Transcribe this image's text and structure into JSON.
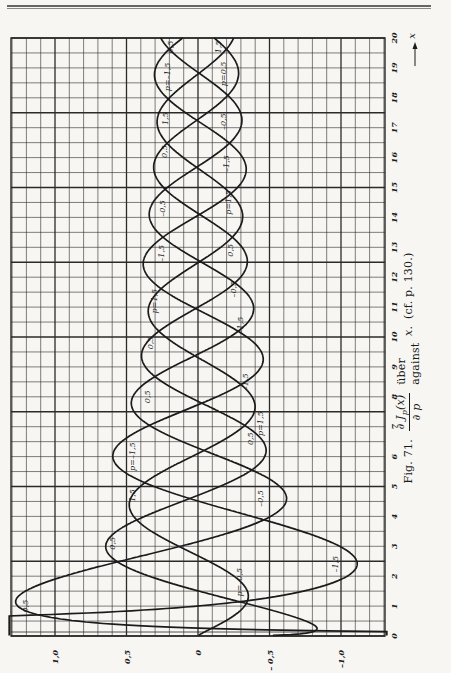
{
  "page": {
    "header_rules": 2
  },
  "caption": {
    "fig_label": "Fig. 71.",
    "formula_numerator": "∂ J",
    "formula_sub": "p",
    "formula_arg": "(x)",
    "formula_denominator": "∂ p",
    "word_german": "über",
    "word_english": "against",
    "variable": "x.",
    "reference": "(cf. p. 130.)"
  },
  "chart_data": {
    "type": "line",
    "orientation": "rotated 90° (x-axis runs vertically, upward; function value runs horizontally, positive to the left)",
    "xlabel": "x",
    "ylabel": "∂J_p(x)/∂p",
    "xlim": [
      0,
      20
    ],
    "ylim": [
      -1.3,
      1.3
    ],
    "x_ticks": [
      0,
      1,
      2,
      3,
      4,
      5,
      6,
      7,
      8,
      9,
      10,
      11,
      12,
      13,
      14,
      15,
      16,
      17,
      18,
      19,
      20
    ],
    "x_tick_labels": [
      "0",
      "1",
      "2",
      "3",
      "4",
      "5",
      "6",
      "7",
      "8",
      "9",
      "10",
      "11",
      "12",
      "13",
      "14",
      "15",
      "16",
      "17",
      "18",
      "19",
      "20"
    ],
    "y_ticks": [
      1.0,
      0.5,
      0,
      -0.5,
      -1.0
    ],
    "y_tick_labels": [
      "1,0",
      "0,5",
      "0",
      "– 0,5",
      "–1,0"
    ],
    "grid": true,
    "grid_minor_x_step": 0.5,
    "grid_minor_y_step": 0.1,
    "legend": "none (curves labelled inline)",
    "series": [
      {
        "name": "p = 0.5",
        "p": 0.5,
        "labels": [
          "0,5",
          "p=0,5",
          "0,5",
          "0,5",
          "0,5",
          "0,5",
          "0,5"
        ],
        "approx_extrema": [
          [
            1.0,
            1.26
          ],
          [
            4.5,
            -0.47
          ],
          [
            7.7,
            0.36
          ],
          [
            10.9,
            -0.31
          ],
          [
            14.0,
            0.27
          ],
          [
            17.2,
            -0.24
          ]
        ]
      },
      {
        "name": "p = -0.5",
        "p": -0.5,
        "labels": [
          "p=-0,5",
          "-0,5",
          "-0,5",
          "-0,5",
          "-0,5"
        ],
        "approx_extrema": [
          [
            0.3,
            -1.05
          ],
          [
            2.9,
            0.53
          ],
          [
            6.1,
            -0.42
          ],
          [
            9.3,
            0.33
          ],
          [
            12.5,
            -0.29
          ],
          [
            15.7,
            0.25
          ],
          [
            18.8,
            -0.23
          ]
        ]
      },
      {
        "name": "p = 1.5",
        "p": 1.5,
        "labels": [
          "1,5",
          "p=1,5",
          "1,5",
          "1,5",
          "1,5"
        ],
        "approx_extrema": [
          [
            2.3,
            -1.0
          ],
          [
            5.8,
            0.43
          ],
          [
            8.9,
            -0.36
          ],
          [
            12.1,
            0.3
          ],
          [
            15.3,
            -0.26
          ],
          [
            18.5,
            0.24
          ]
        ]
      },
      {
        "name": "p = -1.5",
        "p": -1.5,
        "labels": [
          "p=-1,5",
          "-1,5",
          "-1,5",
          "-1,5",
          "-1,5"
        ],
        "approx_extrema": [
          [
            1.2,
            0.55
          ],
          [
            3.9,
            -0.45
          ],
          [
            7.2,
            0.36
          ],
          [
            10.3,
            -0.31
          ],
          [
            13.5,
            0.27
          ],
          [
            16.6,
            -0.25
          ],
          [
            19.8,
            0.22
          ]
        ]
      }
    ],
    "curve_labels": [
      {
        "text": "0,5",
        "x": 1.0,
        "value": 1.23
      },
      {
        "text": "p=-0,5",
        "x": 1.8,
        "value": -0.35
      },
      {
        "text": "-1,5",
        "x": 2.4,
        "value": -1.02
      },
      {
        "text": "0,5",
        "x": 3.1,
        "value": 0.62
      },
      {
        "text": "-0,5",
        "x": 4.6,
        "value": -0.5
      },
      {
        "text": "1,5",
        "x": 4.7,
        "value": 0.48
      },
      {
        "text": "p=-1,5",
        "x": 6.0,
        "value": 0.48
      },
      {
        "text": "0,5",
        "x": 6.6,
        "value": -0.43
      },
      {
        "text": "p=1,5",
        "x": 7.1,
        "value": -0.5
      },
      {
        "text": "0,5",
        "x": 8.0,
        "value": 0.38
      },
      {
        "text": "-1,5",
        "x": 8.5,
        "value": -0.39
      },
      {
        "text": "0,5",
        "x": 9.8,
        "value": 0.36
      },
      {
        "text": "-1,5",
        "x": 10.4,
        "value": -0.36
      },
      {
        "text": "p=1,5",
        "x": 11.2,
        "value": 0.33
      },
      {
        "text": "-0,5",
        "x": 11.6,
        "value": -0.31
      },
      {
        "text": "-1,5",
        "x": 12.8,
        "value": 0.28
      },
      {
        "text": "0,5",
        "x": 12.9,
        "value": -0.29
      },
      {
        "text": "-0,5",
        "x": 14.3,
        "value": 0.27
      },
      {
        "text": "p=1,5",
        "x": 14.5,
        "value": -0.27
      },
      {
        "text": "-1,5",
        "x": 15.8,
        "value": -0.26
      },
      {
        "text": "0,5",
        "x": 16.2,
        "value": 0.26
      },
      {
        "text": "-0,5",
        "x": 17.2,
        "value": -0.24
      },
      {
        "text": "1,5",
        "x": 17.3,
        "value": 0.25
      },
      {
        "text": "p=-1,5",
        "x": 18.7,
        "value": 0.24
      },
      {
        "text": "p=0,5",
        "x": 18.8,
        "value": -0.24
      },
      {
        "text": "0,5",
        "x": 19.7,
        "value": 0.22
      },
      {
        "text": "1,5",
        "x": 19.7,
        "value": -0.2
      }
    ],
    "axis_arrow_label": "x"
  },
  "layout": {
    "plot_left_px": 11,
    "plot_right_px": 385,
    "plot_top_px": 38,
    "plot_bottom_px": 636,
    "zero_value_px": 198,
    "px_per_unit_value": 143,
    "px_per_unit_x": 29.9,
    "line_color": "#1b1b1b",
    "grid_color": "#2a2a2a",
    "paper_color": "#f7f6f3"
  }
}
